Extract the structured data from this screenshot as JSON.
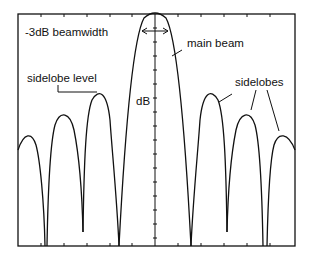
{
  "diagram": {
    "labels": {
      "beamwidth": "-3dB beamwidth",
      "main_beam": "main beam",
      "sidelobe_level": "sidelobe level",
      "sidelobes": "sidelobes",
      "y_axis": "dB"
    },
    "colors": {
      "line": "#111111",
      "background": "#ffffff"
    }
  }
}
